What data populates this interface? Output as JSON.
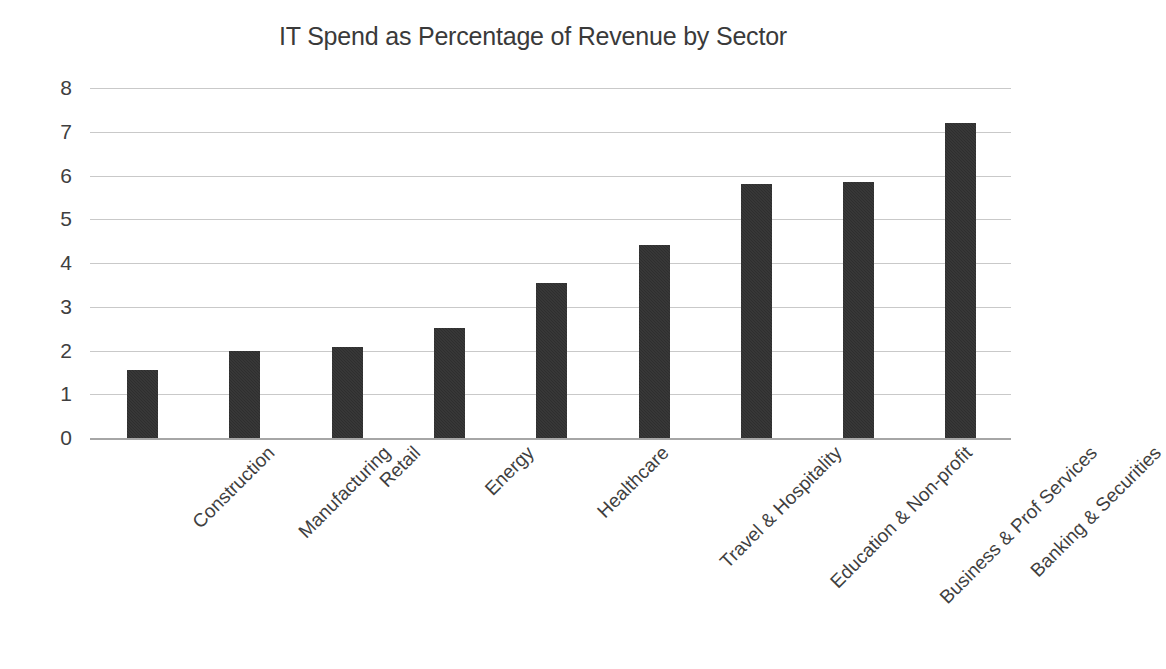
{
  "chart_data": {
    "type": "bar",
    "title": "IT Spend as Percentage of Revenue by Sector",
    "xlabel": "",
    "ylabel": "",
    "ylim": [
      0,
      8
    ],
    "yticks": [
      "8",
      "7",
      "6",
      "5",
      "4",
      "3",
      "2",
      "1",
      "0"
    ],
    "grid": true,
    "legend": false,
    "orientation": "vertical",
    "bar_color": "#2e2e2e",
    "gridline_color": "#c9c9c9",
    "axis_color": "#a6a6a6",
    "categories": [
      "Construction",
      "Manufacturing",
      "Retail",
      "Energy",
      "Healthcare",
      "Travel & Hospitality",
      "Education & Non-profit",
      "Business & Prof Services",
      "Banking & Securities"
    ],
    "values": [
      1.55,
      2.0,
      2.08,
      2.52,
      3.54,
      4.42,
      5.8,
      5.86,
      7.2
    ]
  }
}
